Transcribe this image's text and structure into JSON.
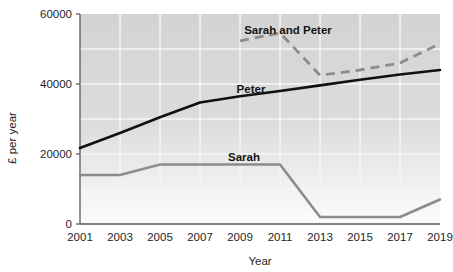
{
  "chart_data": {
    "type": "line",
    "title": "",
    "subtitle": "",
    "xlabel": "Year",
    "ylabel": "£ per year",
    "xlim": [
      2001,
      2019
    ],
    "ylim": [
      0,
      60000
    ],
    "grid": true,
    "legend_position": "inline-annotations",
    "x": [
      2001,
      2003,
      2005,
      2007,
      2009,
      2011,
      2013,
      2015,
      2017,
      2019
    ],
    "xticklabels": [
      "2001",
      "2003",
      "2005",
      "2007",
      "2009",
      "2011",
      "2013",
      "2015",
      "2017",
      "2019"
    ],
    "yticks": [
      0,
      20000,
      40000,
      60000
    ],
    "yticklabels": [
      "0",
      "20000",
      "40000",
      "60000"
    ],
    "series": [
      {
        "name": "Peter",
        "style": "solid",
        "color": "#111111",
        "width": 2.6,
        "x": [
          2001,
          2003,
          2005,
          2007,
          2009,
          2011,
          2013,
          2015,
          2017,
          2019
        ],
        "values": [
          21700,
          26000,
          30500,
          34700,
          36500,
          38000,
          39600,
          41200,
          42700,
          44000
        ],
        "label_x": 2009,
        "label_y": 40500
      },
      {
        "name": "Sarah",
        "style": "solid",
        "color": "#8c8c8c",
        "width": 2.6,
        "x": [
          2001,
          2003,
          2005,
          2007,
          2009,
          2011,
          2013,
          2015,
          2017,
          2019
        ],
        "values": [
          14000,
          14000,
          17000,
          17000,
          17000,
          17000,
          2000,
          2000,
          2000,
          7000
        ],
        "label_x": 2009,
        "label_y": 20300
      },
      {
        "name": "Sarah and Peter",
        "style": "dashed",
        "color": "#8c8c8c",
        "width": 2.8,
        "x": [
          2009,
          2011,
          2013,
          2015,
          2017,
          2019
        ],
        "values": [
          52300,
          54600,
          42500,
          44000,
          46000,
          51500
        ],
        "label_x": 2011,
        "label_y": 57400
      }
    ],
    "colors": {
      "plot_background_top": "#d4d4d4",
      "plot_background_bottom": "#fbfbfb",
      "gridline": "#f4f4f4",
      "axis": "#5a5a5a",
      "peter": "#111111",
      "sarah": "#8c8c8c",
      "sarah_and_peter": "#8c8c8c"
    }
  },
  "axes": {
    "y_title": "£ per year",
    "x_title": "Year",
    "y_tick_labels": [
      "60000",
      "40000",
      "20000",
      "0"
    ],
    "x_tick_labels": [
      "2001",
      "2003",
      "2005",
      "2007",
      "2009",
      "2011",
      "2013",
      "2015",
      "2017",
      "2019"
    ]
  },
  "annotations": {
    "sarah_and_peter": "Sarah and Peter",
    "peter": "Peter",
    "sarah": "Sarah"
  }
}
